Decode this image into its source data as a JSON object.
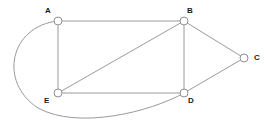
{
  "figure": {
    "kind": "undirected-graph-diagram",
    "background_color": "#ffffff",
    "edge_color": "#9a9a9a",
    "node_fill_color": "#ffffff",
    "node_stroke_color": "#8f8f8f",
    "label_color": "#1a1a1a"
  },
  "nodes": [
    {
      "id": "A",
      "label": "A",
      "x": 58,
      "y": 21,
      "r": 4,
      "label_x": 45,
      "label_y": 7
    },
    {
      "id": "B",
      "label": "B",
      "x": 184,
      "y": 21,
      "r": 4,
      "label_x": 187,
      "label_y": 7
    },
    {
      "id": "C",
      "label": "C",
      "x": 244,
      "y": 58,
      "r": 4,
      "label_x": 254,
      "label_y": 54
    },
    {
      "id": "D",
      "label": "D",
      "x": 184,
      "y": 93,
      "r": 4,
      "label_x": 188,
      "label_y": 97
    },
    {
      "id": "E",
      "label": "E",
      "x": 58,
      "y": 93,
      "r": 4,
      "label_x": 44,
      "label_y": 97
    }
  ],
  "edges": [
    {
      "id": "A-B",
      "from": "A",
      "to": "B",
      "shape": "straight"
    },
    {
      "id": "A-E",
      "from": "A",
      "to": "E",
      "shape": "straight"
    },
    {
      "id": "B-C",
      "from": "B",
      "to": "C",
      "shape": "straight"
    },
    {
      "id": "B-D",
      "from": "B",
      "to": "D",
      "shape": "straight"
    },
    {
      "id": "B-E",
      "from": "B",
      "to": "E",
      "shape": "straight"
    },
    {
      "id": "C-D",
      "from": "C",
      "to": "D",
      "shape": "straight"
    },
    {
      "id": "E-D",
      "from": "E",
      "to": "D",
      "shape": "straight"
    },
    {
      "id": "A-D",
      "from": "A",
      "to": "D",
      "shape": "curved",
      "path": "M 58 21 C 10 26 -2 82 38 108 C 78 130 150 112 184 93"
    }
  ]
}
